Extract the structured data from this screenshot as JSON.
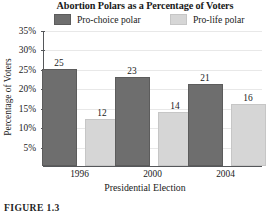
{
  "chart_data": {
    "type": "bar",
    "title": "Abortion Polars as a Percentage of Voters",
    "xlabel": "Presidential Election",
    "ylabel": "Percentage of Voters",
    "categories": [
      "1996",
      "2000",
      "2004"
    ],
    "series": [
      {
        "name": "Pro-choice polar",
        "color": "#6e6e6e",
        "values": [
          25,
          23,
          21
        ]
      },
      {
        "name": "Pro-life polar",
        "color": "#d6d6d6",
        "values": [
          12,
          14,
          16
        ]
      }
    ],
    "ylim": [
      0,
      35
    ],
    "ytick_labels": [
      "5%",
      "10%",
      "15%",
      "20%",
      "25%",
      "30%",
      "35%"
    ],
    "ytick_values": [
      5,
      10,
      15,
      20,
      25,
      30,
      35
    ],
    "grid": true,
    "legend_position": "top",
    "value_labels": true
  },
  "caption": {
    "text": "FIGURE 1.3"
  }
}
